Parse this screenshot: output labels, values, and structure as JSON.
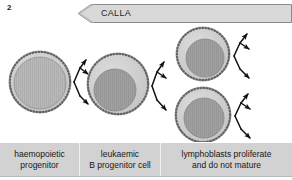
{
  "figure": {
    "number": "2",
    "background": "#ffffff",
    "width": 292,
    "height": 180
  },
  "banner": {
    "label": "CALLA",
    "direction": "left",
    "fill": "#d9d9d9",
    "stroke": "#8a8a8a"
  },
  "palette": {
    "cell_cytoplasm": "#c9c9c9",
    "cell_membrane": "#5a5a5a",
    "nucleus_light": "#b4b4b4",
    "nucleus_dark": "#9a9a9a",
    "arrow": "#111111",
    "label_band": "#d2d2d2",
    "label_divider": "#f2f2f2",
    "text": "#161616"
  },
  "stages": [
    {
      "id": "haemopoietic-progenitor",
      "label_lines": [
        "haemopoietic",
        "progenitor"
      ],
      "cells": [
        {
          "id": "cell-1",
          "cx": 40,
          "cy": 58,
          "r": 31,
          "nucleus_r": 26,
          "nucleus_dx": 0,
          "nucleus_dy": 1,
          "nucleus_shade": "light"
        }
      ],
      "arrow_branches": 3
    },
    {
      "id": "leukaemic-b-progenitor-cell",
      "label_lines": [
        "leukaemic",
        "B progenitor cell"
      ],
      "cells": [
        {
          "id": "cell-2",
          "cx": 118,
          "cy": 60,
          "r": 31,
          "nucleus_r": 21,
          "nucleus_dx": -3,
          "nucleus_dy": 6,
          "nucleus_shade": "dark"
        }
      ],
      "arrow_branches": 3
    },
    {
      "id": "lymphoblasts-proliferate",
      "label_lines": [
        "lymphoblasts proliferate",
        "and do not mature"
      ],
      "cells": [
        {
          "id": "cell-3",
          "cx": 203,
          "cy": 30,
          "r": 27,
          "nucleus_r": 19,
          "nucleus_dx": 2,
          "nucleus_dy": 4,
          "nucleus_shade": "dark"
        },
        {
          "id": "cell-4",
          "cx": 203,
          "cy": 91,
          "r": 28,
          "nucleus_r": 20,
          "nucleus_dx": 1,
          "nucleus_dy": 3,
          "nucleus_shade": "dark"
        }
      ],
      "arrow_branches": 3
    }
  ],
  "labels": {
    "cell_1": "haemopoietic",
    "cell_1b": "progenitor",
    "cell_2": "leukaemic",
    "cell_2b": "B progenitor cell",
    "cell_3": "lymphoblasts proliferate",
    "cell_3b": "and do not mature"
  }
}
